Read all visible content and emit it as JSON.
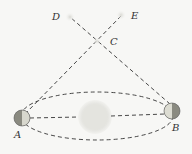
{
  "diagram": {
    "labels": {
      "A": "A",
      "B": "B",
      "C": "C",
      "D": "D",
      "E": "E"
    },
    "colors": {
      "background": "#f7f7f5",
      "lines": "#333333",
      "sun": "#e9e9e4",
      "planet_dark": "#7a7a72",
      "planet_light": "#d6d6cc"
    }
  }
}
